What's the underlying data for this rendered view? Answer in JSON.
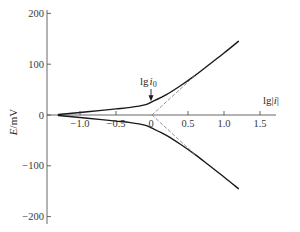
{
  "chart_data": {
    "type": "line",
    "title": "",
    "xlabel": "lg|i|",
    "ylabel": "E/mV",
    "xlim": [
      -1.35,
      1.75
    ],
    "ylim": [
      -210,
      210
    ],
    "grid": false,
    "legend": null,
    "x_ticks": [
      -1.0,
      -0.5,
      0,
      0.5,
      1.0,
      1.5
    ],
    "x_tick_labels": [
      "−1.0",
      "−0.5",
      "0",
      "0.5",
      "1.0",
      "1.5"
    ],
    "y_ticks": [
      200,
      100,
      0,
      -100,
      -200
    ],
    "y_tick_labels": [
      "200",
      "100",
      "0",
      "−100",
      "−200"
    ],
    "annotations": [
      {
        "text": "lg i0",
        "text_main": "lg",
        "text_italic": "i",
        "text_sub": "0",
        "x": 0,
        "y": 25,
        "type": "arrow-down"
      }
    ],
    "series": [
      {
        "name": "anodic branch",
        "style": "solid",
        "x": [
          -1.3,
          -1.0,
          -0.7,
          -0.5,
          -0.3,
          -0.1,
          0.0,
          0.2,
          0.4,
          0.6,
          0.8,
          1.0,
          1.2
        ],
        "y": [
          1,
          5,
          9,
          12,
          15,
          20,
          26,
          40,
          58,
          78,
          100,
          122,
          145
        ]
      },
      {
        "name": "cathodic branch",
        "style": "solid",
        "x": [
          -1.3,
          -1.0,
          -0.7,
          -0.5,
          -0.3,
          -0.1,
          0.0,
          0.2,
          0.4,
          0.6,
          0.8,
          1.0,
          1.2
        ],
        "y": [
          -1,
          -5,
          -9,
          -12,
          -15,
          -20,
          -26,
          -40,
          -58,
          -78,
          -100,
          -122,
          -145
        ]
      },
      {
        "name": "anodic Tafel extrapolation",
        "style": "dashed",
        "x": [
          0.0,
          0.6
        ],
        "y": [
          0,
          78
        ]
      },
      {
        "name": "cathodic Tafel extrapolation",
        "style": "dashed",
        "x": [
          0.0,
          0.6
        ],
        "y": [
          0,
          -78
        ]
      }
    ],
    "colors": {
      "axis": "#555555",
      "curve": "#1a1a1a",
      "dashed": "#8a8a8a",
      "text": "#333333"
    }
  }
}
